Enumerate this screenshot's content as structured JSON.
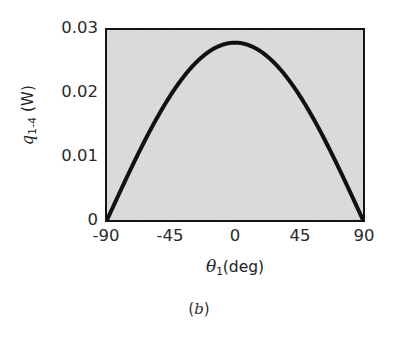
{
  "figure": {
    "caption_open": "(",
    "caption_letter": "b",
    "caption_close": ")"
  },
  "axis": {
    "y_title_symbol": "q",
    "y_title_sub": "1-4",
    "y_title_unit": "(W)",
    "x_title_symbol": "θ",
    "x_title_sub": "1",
    "x_title_unit": "(deg)"
  },
  "style": {
    "panel_fill": "#dcdcdc",
    "frame_color": "#141414",
    "curve_color": "#111111",
    "text_color": "#2a2a2a",
    "page_background": "#ffffff"
  },
  "chart_data": {
    "type": "line",
    "title": "",
    "subtitle": "(b)",
    "xlabel": "θ₁ (deg)",
    "ylabel": "q₁₋₄ (W)",
    "xlim": [
      -90,
      90
    ],
    "ylim": [
      0,
      0.03
    ],
    "xticks": [
      -90,
      -45,
      0,
      45,
      90
    ],
    "xticklabels": [
      "-90",
      "-45",
      "0",
      "45",
      "90"
    ],
    "yticks": [
      0,
      0.01,
      0.02,
      0.03
    ],
    "yticklabels": [
      "0",
      "0.01",
      "0.02",
      "0.03"
    ],
    "grid": false,
    "legend": null,
    "legend_position": "none",
    "series": [
      {
        "name": "q_1-4",
        "line_width_px": 4,
        "color": "#111111",
        "x": [
          -90,
          -85,
          -80,
          -75,
          -70,
          -65,
          -60,
          -55,
          -50,
          -45,
          -40,
          -35,
          -30,
          -25,
          -20,
          -15,
          -10,
          -5,
          0,
          5,
          10,
          15,
          20,
          25,
          30,
          35,
          40,
          45,
          50,
          55,
          60,
          65,
          70,
          75,
          80,
          85,
          90
        ],
        "y": [
          0.0,
          0.00213,
          0.00424,
          0.0063,
          0.00831,
          0.01025,
          0.0121,
          0.01386,
          0.0155,
          0.01703,
          0.01842,
          0.01968,
          0.02079,
          0.02175,
          0.02255,
          0.02319,
          0.02366,
          0.02396,
          0.028,
          0.02396,
          0.02366,
          0.02319,
          0.02255,
          0.02175,
          0.02079,
          0.01968,
          0.01842,
          0.01703,
          0.0155,
          0.01386,
          0.0121,
          0.01025,
          0.00831,
          0.0063,
          0.00424,
          0.00213,
          0.0
        ]
      }
    ],
    "peak": {
      "x": 0,
      "y": 0.028
    },
    "endpoints": [
      {
        "x": -90,
        "y": 0
      },
      {
        "x": 90,
        "y": 0
      }
    ]
  },
  "ytick_labels": [
    {
      "value": 0.03,
      "text": "0.03"
    },
    {
      "value": 0.02,
      "text": "0.02"
    },
    {
      "value": 0.01,
      "text": "0.01"
    },
    {
      "value": 0,
      "text": "0"
    }
  ],
  "xtick_labels": [
    {
      "value": -90,
      "text": "-90"
    },
    {
      "value": -45,
      "text": "-45"
    },
    {
      "value": 0,
      "text": "0"
    },
    {
      "value": 45,
      "text": "45"
    },
    {
      "value": 90,
      "text": "90"
    }
  ]
}
